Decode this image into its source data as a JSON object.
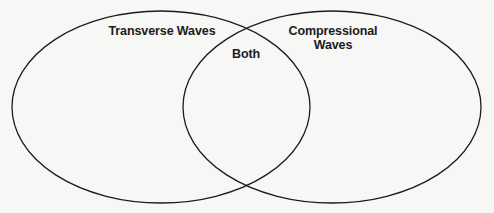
{
  "diagram": {
    "type": "venn",
    "sets": [
      {
        "id": "left",
        "label": "Transverse Waves"
      },
      {
        "id": "right",
        "label": "Compressional Waves",
        "label_lines": [
          "Compressional",
          "Waves"
        ]
      }
    ],
    "intersection": {
      "label": "Both"
    },
    "stroke_color": "#1c1c1c",
    "background_color": "#f7f7f5"
  }
}
